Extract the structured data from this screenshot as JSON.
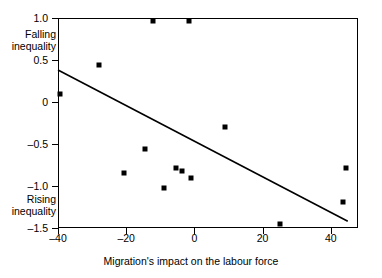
{
  "chart_data": {
    "type": "scatter",
    "title": "",
    "xlabel": "Migration's impact on the labour force",
    "ylabel": "",
    "xlim": [
      -40,
      48
    ],
    "ylim": [
      -1.5,
      1.0
    ],
    "grid": false,
    "legend": null,
    "xticks": [
      {
        "value": -40,
        "label": "–40"
      },
      {
        "value": -20,
        "label": "–20"
      },
      {
        "value": 0,
        "label": "0"
      },
      {
        "value": 20,
        "label": "20"
      },
      {
        "value": 40,
        "label": "40"
      }
    ],
    "yticks": [
      {
        "value": 1.0,
        "label": "1.0"
      },
      {
        "value": 0.5,
        "label": "0.5"
      },
      {
        "value": 0,
        "label": "0"
      },
      {
        "value": -0.5,
        "label": "–0.5"
      },
      {
        "value": -1.0,
        "label": "–1.0"
      },
      {
        "value": -1.5,
        "label": "–1.5"
      }
    ],
    "axis_annotations": {
      "top_left": "Falling\ninequality",
      "bottom_left": "Rising\ninequality",
      "falling_line1": "Falling",
      "falling_line2": "inequality",
      "rising_line1": "Rising",
      "rising_line2": "inequality"
    },
    "points": [
      {
        "name": "Sweden",
        "x": -12.0,
        "y": 0.96,
        "label_pos": "left"
      },
      {
        "name": "Denmark",
        "x": -1.5,
        "y": 0.97,
        "label_pos": "right"
      },
      {
        "name": "Norway",
        "x": -28.0,
        "y": 0.44,
        "label_pos": "above"
      },
      {
        "name": "Italy",
        "x": -39.4,
        "y": 0.09,
        "label_pos": "right"
      },
      {
        "name": "Belgium",
        "x": 9.0,
        "y": -0.3,
        "label_pos": "above"
      },
      {
        "name": "Portugal",
        "x": -14.5,
        "y": -0.56,
        "label_pos": "left"
      },
      {
        "name": "Netherlands",
        "x": -5.5,
        "y": -0.78,
        "label_pos": "above"
      },
      {
        "name": "Germany",
        "x": -3.5,
        "y": -0.82,
        "label_pos": "right"
      },
      {
        "name": "United Kingdom",
        "x": -20.5,
        "y": -0.85,
        "label_pos": "left"
      },
      {
        "name": "France",
        "x": -1.0,
        "y": -0.9,
        "label_pos": "right"
      },
      {
        "name": "Spain",
        "x": -9.0,
        "y": -1.02,
        "label_pos": "left"
      },
      {
        "name": "Canada",
        "x": 44.5,
        "y": -0.78,
        "label_pos": "above"
      },
      {
        "name": "Australia",
        "x": 43.5,
        "y": -1.19,
        "label_pos": "above"
      },
      {
        "name": "United States",
        "x": 25.0,
        "y": -1.45,
        "label_pos": "above"
      }
    ],
    "trendline": {
      "x0": -40.0,
      "y0": 0.38,
      "x1": 45.0,
      "y1": -1.42
    }
  }
}
